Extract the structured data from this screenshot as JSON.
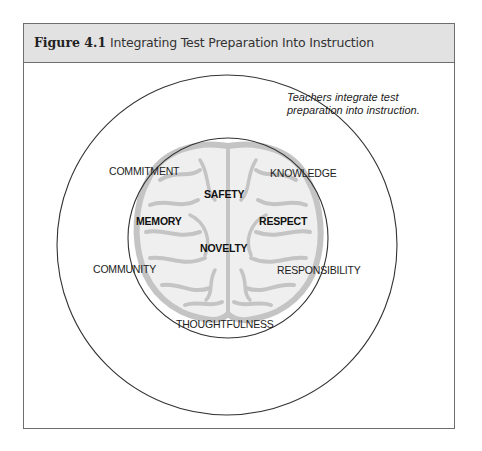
{
  "figure": {
    "label": "Figure 4.1",
    "title": "Integrating Test Preparation Into Instruction"
  },
  "outer_circle": {
    "note_line1": "Teachers integrate test",
    "note_line2": "preparation into instruction."
  },
  "core_values": [
    "SAFETY",
    "MEMORY",
    "RESPECT",
    "NOVELTY"
  ],
  "ring_values": [
    "COMMITMENT",
    "KNOWLEDGE",
    "COMMUNITY",
    "RESPONSIBILITY",
    "THOUGHTFULNESS"
  ],
  "icons": {
    "center": "brain-icon"
  },
  "colors": {
    "header_bg": "#e2e2e2",
    "border": "#6e6e6e",
    "brain": "#c8c8c8",
    "circle_stroke": "#333333"
  }
}
